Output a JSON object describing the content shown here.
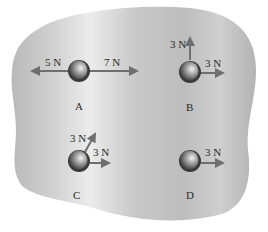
{
  "diagram": {
    "title": "",
    "surface": "ice-surface",
    "colors": {
      "surface_light": "#e9e9e9",
      "surface_mid": "#c4c4c4",
      "surface_dark": "#a9a9a9",
      "arrow": "#6f6f6f",
      "text": "#2a2a2a"
    },
    "pucks": [
      {
        "id": "A",
        "label": "A",
        "forces": [
          {
            "label": "5 N",
            "direction": "left",
            "magnitude": 5
          },
          {
            "label": "7 N",
            "direction": "right",
            "magnitude": 7
          }
        ]
      },
      {
        "id": "B",
        "label": "B",
        "forces": [
          {
            "label": "3 N",
            "direction": "up",
            "magnitude": 3
          },
          {
            "label": "3 N",
            "direction": "right",
            "magnitude": 3
          }
        ]
      },
      {
        "id": "C",
        "label": "C",
        "forces": [
          {
            "label": "3 N",
            "direction": "up-right",
            "magnitude": 3
          },
          {
            "label": "3 N",
            "direction": "right",
            "magnitude": 3
          }
        ]
      },
      {
        "id": "D",
        "label": "D",
        "forces": [
          {
            "label": "3 N",
            "direction": "right",
            "magnitude": 3
          }
        ]
      }
    ]
  }
}
